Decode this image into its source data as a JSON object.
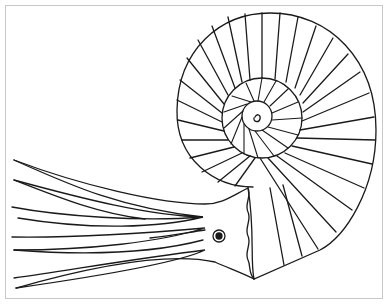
{
  "image": {
    "subject": "nautilus line drawing",
    "description": "Black and white coloring-page style outline of a nautilus with spiral chambered shell and tentacles",
    "colors": {
      "line": "#1a1a1a",
      "background": "#ffffff",
      "frame": "#c8c8c8"
    }
  }
}
